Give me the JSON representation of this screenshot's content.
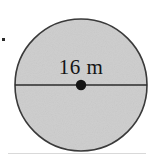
{
  "figure": {
    "type": "geometry-diagram",
    "shape": "circle",
    "background_color": "#ffffff",
    "fill_color": "#cdcdcd",
    "stroke_color": "#3a3a3a",
    "text_color": "#151515",
    "label": "16 m",
    "measurement": {
      "value": "16",
      "unit": "m",
      "quantity": "diameter"
    },
    "geometry": {
      "center_x": "81",
      "center_y": "85",
      "radius": "66"
    },
    "marks": {
      "center_point": "center-dot",
      "diameter_line": "horizontal-diameter",
      "bullet": "list-bullet-mark"
    }
  }
}
